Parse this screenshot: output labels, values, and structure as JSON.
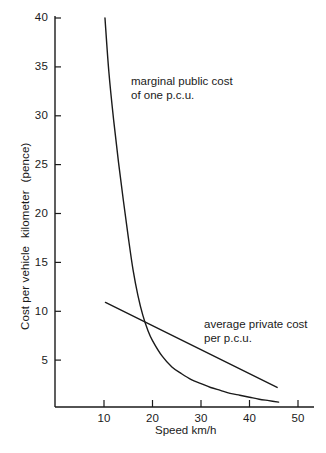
{
  "figure": {
    "background": "#ffffff",
    "ink_color": "#1a1a1a"
  },
  "axes": {
    "x": {
      "label": "Speed km/h",
      "ticks": [
        "10",
        "20",
        "30",
        "40",
        "50"
      ],
      "tick_values": [
        10,
        20,
        30,
        40,
        50
      ],
      "range": [
        2.5,
        52
      ]
    },
    "y": {
      "label_part1": "Cost per vehicle",
      "label_part2": "kilometer",
      "label_part3": "(pence)",
      "ticks": [
        "5",
        "10",
        "15",
        "20",
        "25",
        "30",
        "35",
        "40"
      ],
      "tick_values": [
        5,
        10,
        15,
        20,
        25,
        30,
        35,
        40
      ],
      "range": [
        0,
        41
      ]
    }
  },
  "annotations": {
    "marginal": {
      "line1": "marginal public cost",
      "line2": "of one p.c.u."
    },
    "average": {
      "line1": "average private cost",
      "line2": "per p.c.u."
    }
  },
  "chart_data": {
    "type": "line",
    "title": "",
    "xlabel": "Speed km/h",
    "ylabel": "Cost per vehicle kilometer (pence)",
    "xlim": [
      2.5,
      52
    ],
    "ylim": [
      0,
      41
    ],
    "xticks": [
      10,
      20,
      30,
      40,
      50
    ],
    "yticks": [
      5,
      10,
      15,
      20,
      25,
      30,
      35,
      40
    ],
    "grid": false,
    "legend": "inline-annotations",
    "series": [
      {
        "name": "marginal public cost of one p.c.u.",
        "color": "#1a1a1a",
        "x": [
          10.2,
          11.0,
          12.0,
          13.0,
          14.0,
          15.0,
          16.0,
          17.0,
          18.0,
          19.0,
          20.0,
          22.0,
          24.0,
          26.0,
          28.0,
          30.0,
          32.0,
          34.0,
          36.0,
          38.0,
          40.0,
          42.0,
          44.0,
          46.0
        ],
        "y": [
          40.0,
          34.5,
          29.5,
          25.2,
          21.3,
          17.6,
          14.2,
          11.6,
          9.6,
          8.1,
          7.0,
          5.4,
          4.3,
          3.6,
          3.0,
          2.6,
          2.2,
          1.9,
          1.6,
          1.4,
          1.2,
          1.0,
          0.85,
          0.7
        ]
      },
      {
        "name": "average private cost per p.c.u.",
        "color": "#1a1a1a",
        "x": [
          10.3,
          45.7
        ],
        "y": [
          10.9,
          2.2
        ]
      }
    ],
    "intersection": {
      "x": 18.5,
      "y": 8.7
    }
  }
}
